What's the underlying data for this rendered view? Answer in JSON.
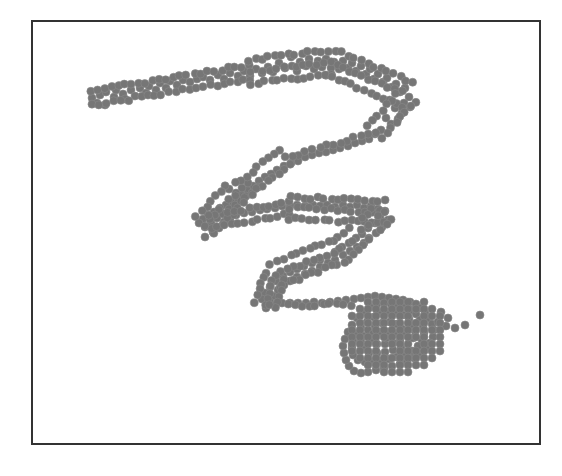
{
  "chart_data": {
    "type": "scatter",
    "title": "",
    "xlabel": "",
    "ylabel": "",
    "grid": false,
    "legend": null,
    "axes_ticks": false,
    "frame": {
      "x": 31,
      "y": 20,
      "width": 510,
      "height": 424,
      "color": "#333333"
    },
    "marker": {
      "shape": "circle",
      "radius": 4,
      "color": "#767676"
    },
    "path_segments": [
      {
        "from": [
          92,
          98
        ],
        "to": [
          250,
          72
        ],
        "band_width": 14
      },
      {
        "from": [
          250,
          72
        ],
        "to": [
          330,
          62
        ],
        "band_width": 24
      },
      {
        "from": [
          330,
          62
        ],
        "to": [
          408,
          95
        ],
        "band_width": 26
      },
      {
        "from": [
          408,
          95
        ],
        "to": [
          375,
          132
        ],
        "band_width": 18
      },
      {
        "from": [
          375,
          132
        ],
        "to": [
          285,
          158
        ],
        "band_width": 10
      },
      {
        "from": [
          285,
          158
        ],
        "to": [
          235,
          195
        ],
        "band_width": 18
      },
      {
        "from": [
          235,
          195
        ],
        "to": [
          205,
          225
        ],
        "band_width": 24
      },
      {
        "from": [
          210,
          222
        ],
        "to": [
          290,
          208
        ],
        "band_width": 12
      },
      {
        "from": [
          290,
          208
        ],
        "to": [
          385,
          212
        ],
        "band_width": 22
      },
      {
        "from": [
          385,
          212
        ],
        "to": [
          340,
          250
        ],
        "band_width": 22
      },
      {
        "from": [
          340,
          250
        ],
        "to": [
          275,
          275
        ],
        "band_width": 24
      },
      {
        "from": [
          275,
          275
        ],
        "to": [
          265,
          305
        ],
        "band_width": 20
      },
      {
        "from": [
          268,
          305
        ],
        "to": [
          350,
          305
        ],
        "band_width": 10
      }
    ],
    "blob": {
      "center": [
        392,
        335
      ],
      "rx": 52,
      "ry": 40
    },
    "outliers": [
      [
        465,
        325
      ],
      [
        480,
        315
      ]
    ],
    "points": [
      [
        92,
        98
      ],
      [
        100,
        95
      ],
      [
        97,
        103
      ],
      [
        105,
        105
      ],
      [
        106,
        92
      ],
      [
        114,
        97
      ],
      [
        116,
        90
      ],
      [
        123,
        94
      ],
      [
        125,
        99
      ],
      [
        131,
        90
      ],
      [
        135,
        96
      ],
      [
        140,
        88
      ],
      [
        146,
        93
      ],
      [
        149,
        86
      ],
      [
        156,
        90
      ],
      [
        160,
        83
      ],
      [
        166,
        88
      ],
      [
        170,
        81
      ],
      [
        177,
        85
      ],
      [
        183,
        80
      ],
      [
        190,
        82
      ],
      [
        197,
        79
      ],
      [
        203,
        77
      ],
      [
        210,
        80
      ],
      [
        218,
        75
      ],
      [
        224,
        79
      ],
      [
        230,
        73
      ],
      [
        238,
        76
      ],
      [
        244,
        71
      ],
      [
        250,
        76
      ],
      [
        256,
        69
      ],
      [
        262,
        73
      ],
      [
        268,
        67
      ],
      [
        273,
        72
      ],
      [
        279,
        63
      ],
      [
        285,
        68
      ],
      [
        291,
        57
      ],
      [
        292,
        66
      ],
      [
        297,
        71
      ],
      [
        300,
        62
      ],
      [
        306,
        66
      ],
      [
        309,
        59
      ],
      [
        314,
        69
      ],
      [
        318,
        61
      ],
      [
        322,
        67
      ],
      [
        326,
        59
      ],
      [
        331,
        68
      ],
      [
        334,
        62
      ],
      [
        339,
        69
      ],
      [
        343,
        61
      ],
      [
        348,
        68
      ],
      [
        352,
        63
      ],
      [
        356,
        71
      ],
      [
        361,
        66
      ],
      [
        366,
        74
      ],
      [
        370,
        69
      ],
      [
        374,
        79
      ],
      [
        378,
        74
      ],
      [
        383,
        82
      ],
      [
        387,
        78
      ],
      [
        392,
        87
      ],
      [
        396,
        84
      ],
      [
        400,
        92
      ],
      [
        405,
        88
      ],
      [
        409,
        97
      ],
      [
        404,
        103
      ],
      [
        410,
        107
      ],
      [
        402,
        113
      ],
      [
        395,
        108
      ],
      [
        398,
        119
      ],
      [
        391,
        124
      ],
      [
        386,
        118
      ],
      [
        381,
        130
      ],
      [
        375,
        134
      ],
      [
        369,
        139
      ],
      [
        362,
        141
      ],
      [
        355,
        143
      ],
      [
        348,
        146
      ],
      [
        340,
        148
      ],
      [
        333,
        150
      ],
      [
        326,
        152
      ],
      [
        319,
        153
      ],
      [
        312,
        155
      ],
      [
        305,
        157
      ],
      [
        298,
        161
      ],
      [
        291,
        163
      ],
      [
        284,
        166
      ],
      [
        277,
        170
      ],
      [
        271,
        174
      ],
      [
        265,
        177
      ],
      [
        259,
        181
      ],
      [
        253,
        186
      ],
      [
        247,
        190
      ],
      [
        241,
        194
      ],
      [
        236,
        198
      ],
      [
        231,
        202
      ],
      [
        226,
        205
      ],
      [
        220,
        208
      ],
      [
        214,
        212
      ],
      [
        208,
        215
      ],
      [
        203,
        219
      ],
      [
        199,
        223
      ],
      [
        205,
        227
      ],
      [
        211,
        223
      ],
      [
        217,
        218
      ],
      [
        223,
        214
      ],
      [
        229,
        209
      ],
      [
        235,
        205
      ],
      [
        241,
        201
      ],
      [
        246,
        196
      ],
      [
        252,
        193
      ],
      [
        242,
        188
      ],
      [
        248,
        183
      ],
      [
        236,
        193
      ],
      [
        258,
        187
      ],
      [
        213,
        232
      ],
      [
        205,
        237
      ],
      [
        219,
        228
      ],
      [
        224,
        222
      ],
      [
        230,
        219
      ],
      [
        236,
        215
      ],
      [
        244,
        213
      ],
      [
        252,
        212
      ],
      [
        260,
        210
      ],
      [
        267,
        209
      ],
      [
        275,
        208
      ],
      [
        282,
        206
      ],
      [
        290,
        206
      ],
      [
        297,
        205
      ],
      [
        305,
        206
      ],
      [
        313,
        205
      ],
      [
        320,
        206
      ],
      [
        327,
        205
      ],
      [
        335,
        207
      ],
      [
        343,
        205
      ],
      [
        350,
        207
      ],
      [
        357,
        205
      ],
      [
        364,
        208
      ],
      [
        371,
        206
      ],
      [
        378,
        209
      ],
      [
        385,
        211
      ],
      [
        380,
        217
      ],
      [
        388,
        220
      ],
      [
        375,
        223
      ],
      [
        382,
        227
      ],
      [
        368,
        228
      ],
      [
        376,
        233
      ],
      [
        362,
        234
      ],
      [
        369,
        238
      ],
      [
        356,
        238
      ],
      [
        364,
        243
      ],
      [
        349,
        243
      ],
      [
        357,
        247
      ],
      [
        342,
        247
      ],
      [
        350,
        251
      ],
      [
        335,
        252
      ],
      [
        343,
        255
      ],
      [
        327,
        256
      ],
      [
        335,
        260
      ],
      [
        320,
        260
      ],
      [
        328,
        263
      ],
      [
        312,
        263
      ],
      [
        320,
        267
      ],
      [
        304,
        266
      ],
      [
        312,
        271
      ],
      [
        297,
        269
      ],
      [
        305,
        274
      ],
      [
        290,
        272
      ],
      [
        297,
        277
      ],
      [
        283,
        276
      ],
      [
        290,
        281
      ],
      [
        276,
        281
      ],
      [
        284,
        285
      ],
      [
        270,
        287
      ],
      [
        278,
        290
      ],
      [
        265,
        293
      ],
      [
        273,
        296
      ],
      [
        262,
        299
      ],
      [
        270,
        302
      ],
      [
        266,
        308
      ],
      [
        275,
        305
      ],
      [
        282,
        303
      ],
      [
        290,
        303
      ],
      [
        298,
        303
      ],
      [
        306,
        303
      ],
      [
        314,
        302
      ],
      [
        322,
        303
      ],
      [
        330,
        302
      ],
      [
        338,
        301
      ],
      [
        346,
        300
      ],
      [
        354,
        299
      ],
      [
        361,
        298
      ],
      [
        368,
        297
      ],
      [
        375,
        296
      ],
      [
        382,
        297
      ],
      [
        389,
        298
      ],
      [
        396,
        299
      ],
      [
        403,
        300
      ],
      [
        410,
        302
      ],
      [
        416,
        304
      ],
      [
        421,
        308
      ],
      [
        425,
        313
      ],
      [
        429,
        318
      ],
      [
        432,
        324
      ],
      [
        434,
        330
      ],
      [
        433,
        337
      ],
      [
        430,
        343
      ],
      [
        426,
        349
      ],
      [
        421,
        354
      ],
      [
        414,
        358
      ],
      [
        407,
        361
      ],
      [
        400,
        364
      ],
      [
        392,
        366
      ],
      [
        384,
        368
      ],
      [
        376,
        370
      ],
      [
        368,
        372
      ],
      [
        361,
        373
      ],
      [
        354,
        371
      ],
      [
        349,
        366
      ],
      [
        346,
        360
      ],
      [
        344,
        353
      ],
      [
        343,
        346
      ],
      [
        345,
        339
      ],
      [
        348,
        332
      ],
      [
        352,
        325
      ],
      [
        357,
        318
      ],
      [
        363,
        312
      ],
      [
        370,
        307
      ],
      [
        377,
        304
      ],
      [
        384,
        303
      ],
      [
        391,
        304
      ],
      [
        398,
        305
      ],
      [
        405,
        307
      ],
      [
        411,
        310
      ],
      [
        416,
        314
      ],
      [
        420,
        320
      ],
      [
        423,
        326
      ],
      [
        424,
        333
      ],
      [
        422,
        340
      ],
      [
        418,
        346
      ],
      [
        412,
        351
      ],
      [
        405,
        355
      ],
      [
        397,
        357
      ],
      [
        389,
        359
      ],
      [
        381,
        361
      ],
      [
        373,
        362
      ],
      [
        365,
        362
      ],
      [
        358,
        360
      ],
      [
        353,
        355
      ],
      [
        352,
        348
      ],
      [
        353,
        341
      ],
      [
        356,
        334
      ],
      [
        361,
        328
      ],
      [
        367,
        322
      ],
      [
        374,
        317
      ],
      [
        381,
        313
      ],
      [
        389,
        312
      ],
      [
        396,
        313
      ],
      [
        403,
        315
      ],
      [
        409,
        319
      ],
      [
        413,
        325
      ],
      [
        415,
        331
      ],
      [
        413,
        338
      ],
      [
        408,
        344
      ],
      [
        401,
        348
      ],
      [
        393,
        350
      ],
      [
        385,
        352
      ],
      [
        377,
        353
      ],
      [
        369,
        353
      ],
      [
        363,
        349
      ],
      [
        361,
        342
      ],
      [
        363,
        336
      ],
      [
        368,
        330
      ],
      [
        375,
        326
      ],
      [
        382,
        323
      ],
      [
        390,
        322
      ],
      [
        397,
        324
      ],
      [
        402,
        329
      ],
      [
        404,
        335
      ],
      [
        400,
        341
      ],
      [
        393,
        343
      ],
      [
        385,
        344
      ],
      [
        377,
        344
      ],
      [
        371,
        340
      ],
      [
        373,
        334
      ],
      [
        380,
        332
      ],
      [
        388,
        332
      ],
      [
        394,
        334
      ],
      [
        386,
        338
      ],
      [
        448,
        318
      ],
      [
        446,
        326
      ],
      [
        441,
        312
      ],
      [
        438,
        322
      ],
      [
        455,
        328
      ],
      [
        465,
        325
      ],
      [
        480,
        315
      ]
    ]
  }
}
